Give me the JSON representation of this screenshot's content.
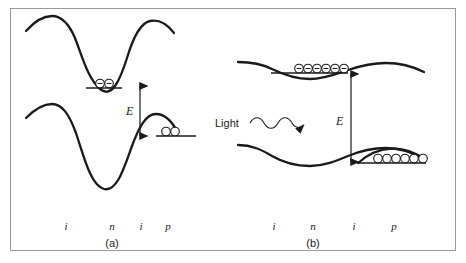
{
  "figure": {
    "width": 466,
    "height": 263,
    "background": "#ffffff",
    "frame_color": "#9a9a9a",
    "line_color": "#1a1a1a"
  },
  "panels": [
    {
      "id": "a",
      "caption": "(a)",
      "region_labels": [
        "i",
        "n",
        "i",
        "p"
      ],
      "energy_label": "E",
      "carriers_conduction": 2,
      "carriers_valence": 2,
      "carrier_symbol": "electron-circle"
    },
    {
      "id": "b",
      "caption": "(b)",
      "region_labels": [
        "i",
        "n",
        "i",
        "p"
      ],
      "energy_label": "E",
      "light_label": "Light",
      "carriers_conduction": 6,
      "carriers_valence": 6,
      "carrier_symbol": "electron-circle"
    }
  ]
}
